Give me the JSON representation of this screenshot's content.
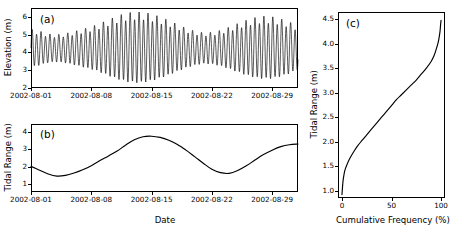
{
  "figure": {
    "background_color": "#ffffff",
    "line_color": "#000000",
    "axis_color": "#000000"
  },
  "panels": {
    "a": {
      "tag": "(a)",
      "ylabel": "Elevation (m)",
      "xlabel": "",
      "yticks": [
        "2",
        "3",
        "4",
        "5",
        "6"
      ],
      "xticks": [
        "2002-08-01",
        "2002-08-08",
        "2002-08-15",
        "2002-08-22",
        "2002-08-29"
      ]
    },
    "b": {
      "tag": "(b)",
      "ylabel": "Tidal Range (m)",
      "xlabel": "Date",
      "yticks": [
        "1",
        "2",
        "3",
        "4"
      ],
      "xticks": [
        "2002-08-01",
        "2002-08-08",
        "2002-08-15",
        "2002-08-22",
        "2002-08-29"
      ]
    },
    "c": {
      "tag": "(c)",
      "ylabel": "Tidal Range (m)",
      "xlabel": "Cumulative Frequency (%)",
      "yticks": [
        "1.0",
        "1.5",
        "2.0",
        "2.5",
        "3.0",
        "3.5",
        "4.0",
        "4.5"
      ],
      "xticks": [
        "0",
        "50",
        "100"
      ]
    }
  },
  "chart_data": [
    {
      "type": "line",
      "panel": "a",
      "title": "(a)",
      "xlabel": "",
      "ylabel": "Elevation (m)",
      "xtick_labels": [
        "2002-08-01",
        "2002-08-08",
        "2002-08-15",
        "2002-08-22",
        "2002-08-29"
      ],
      "xtick_days": [
        0,
        7,
        14,
        21,
        28
      ],
      "ytick_values": [
        2,
        3,
        4,
        5,
        6
      ],
      "xlim_days": [
        0,
        31
      ],
      "ylim": [
        2,
        6.5
      ],
      "grid": false,
      "legend": null,
      "description": "Semi-diurnal water elevation time series modulated by a spring-neap envelope; two spring maxima and two neap minima over the month.",
      "mean_level": 4.2,
      "tidal_period_hours": 12.42,
      "samples_per_day": 48,
      "envelope_half_range_by_day": [
        1.0,
        0.9,
        0.76,
        0.72,
        0.78,
        0.88,
        1.0,
        1.12,
        1.28,
        1.48,
        1.66,
        1.8,
        1.87,
        1.86,
        1.76,
        1.62,
        1.44,
        1.24,
        1.05,
        0.9,
        0.82,
        0.84,
        0.94,
        1.1,
        1.28,
        1.45,
        1.58,
        1.65,
        1.63,
        1.52,
        1.36,
        1.15
      ]
    },
    {
      "type": "line",
      "panel": "b",
      "title": "(b)",
      "xlabel": "Date",
      "ylabel": "Tidal Range (m)",
      "xtick_labels": [
        "2002-08-01",
        "2002-08-08",
        "2002-08-15",
        "2002-08-22",
        "2002-08-29"
      ],
      "xtick_days": [
        0,
        7,
        14,
        21,
        28
      ],
      "ytick_values": [
        1,
        2,
        3,
        4
      ],
      "xlim_days": [
        0,
        31
      ],
      "ylim": [
        0.55,
        4.45
      ],
      "grid": false,
      "legend": null,
      "description": "Tidal range envelope over the month showing two full spring-neap cycles. Neap minima near 1.45 m (Aug 3) and 1.62 m (Aug 17); spring maxima near 3.75 m (Aug 12) and 3.30 m (Aug 24).",
      "x_days": [
        0,
        1,
        2,
        3,
        4,
        5,
        6,
        7,
        8,
        9,
        10,
        11,
        12,
        13,
        14,
        15,
        16,
        17,
        18,
        19,
        20,
        21,
        22,
        23,
        24,
        25,
        26,
        27,
        28,
        29,
        30,
        31
      ],
      "values": [
        2.02,
        1.8,
        1.58,
        1.46,
        1.5,
        1.64,
        1.83,
        2.06,
        2.35,
        2.62,
        2.9,
        3.25,
        3.55,
        3.72,
        3.75,
        3.68,
        3.52,
        3.28,
        2.95,
        2.58,
        2.2,
        1.85,
        1.66,
        1.62,
        1.78,
        2.05,
        2.38,
        2.7,
        2.95,
        3.15,
        3.26,
        3.3
      ]
    },
    {
      "type": "line",
      "panel": "c",
      "title": "(c)",
      "xlabel": "Cumulative Frequency (%)",
      "ylabel": "Tidal Range (m)",
      "xtick_values": [
        0,
        50,
        100
      ],
      "ytick_values": [
        1.0,
        1.5,
        2.0,
        2.5,
        3.0,
        3.5,
        4.0,
        4.5
      ],
      "xlim": [
        -4,
        104
      ],
      "ylim": [
        0.85,
        4.65
      ],
      "grid": false,
      "legend": null,
      "description": "Cumulative frequency distribution of tidal range; sigmoid rising from about 0.92 m at 0% to about 4.48 m at 100%, with a steep knee below 3% and a steep tail above 95%.",
      "x_cumfreq_percent": [
        0,
        1,
        2,
        3,
        5,
        8,
        12,
        16,
        20,
        25,
        30,
        35,
        40,
        45,
        50,
        55,
        60,
        65,
        70,
        75,
        80,
        85,
        90,
        93,
        95,
        97,
        98,
        99,
        99.5,
        100
      ],
      "y_tidal_range_m": [
        0.92,
        1.18,
        1.32,
        1.42,
        1.53,
        1.66,
        1.8,
        1.92,
        2.02,
        2.14,
        2.26,
        2.38,
        2.5,
        2.62,
        2.74,
        2.86,
        2.96,
        3.06,
        3.16,
        3.26,
        3.38,
        3.5,
        3.64,
        3.76,
        3.88,
        4.02,
        4.12,
        4.26,
        4.38,
        4.48
      ]
    }
  ]
}
